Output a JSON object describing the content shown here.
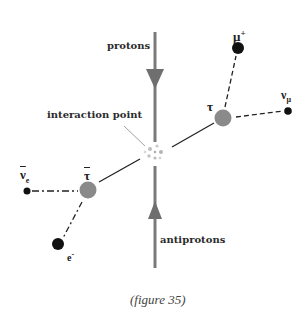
{
  "labels": {
    "protons": "protons",
    "antiprotons": "antiprotons",
    "interaction_point": "interaction point"
  },
  "particles": {
    "tau": {
      "symbol": "τ",
      "color": "#8a8a8a"
    },
    "anti_tau": {
      "symbol": "τ",
      "bar": true,
      "color": "#8a8a8a"
    },
    "muon_plus": {
      "symbol": "μ",
      "charge": "+",
      "color": "#111111"
    },
    "nu_mu": {
      "symbol": "ν",
      "subscript": "μ",
      "color": "#111111"
    },
    "anti_nu_e": {
      "symbol": "ν",
      "subscript": "e",
      "bar": true,
      "color": "#111111"
    },
    "electron": {
      "symbol": "e",
      "charge": "-",
      "color": "#111111"
    }
  },
  "beams": {
    "color": "#7a7a7a"
  },
  "caption": "(figure 35)"
}
